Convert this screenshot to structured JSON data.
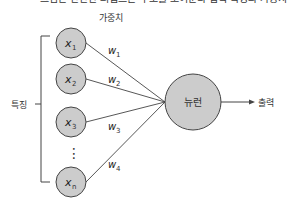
{
  "top_clip_text": "그림은 간단한 퍼셉트론 구조를 보여준다 입력 특징과 가중치",
  "weights_header": "가중치",
  "features_label": "특징",
  "neuron_label": "뉴런",
  "output_label": "출력",
  "inputs": [
    {
      "name": "x",
      "sub": "1"
    },
    {
      "name": "x",
      "sub": "2"
    },
    {
      "name": "x",
      "sub": "3"
    },
    {
      "name": "x",
      "sub": "n"
    }
  ],
  "weights": [
    {
      "name": "w",
      "sub": "1"
    },
    {
      "name": "w",
      "sub": "2"
    },
    {
      "name": "w",
      "sub": "3"
    },
    {
      "name": "w",
      "sub": "4"
    }
  ],
  "ellipsis": "⋮",
  "colors": {
    "node_fill": "#cccccc",
    "stroke": "#444444"
  }
}
